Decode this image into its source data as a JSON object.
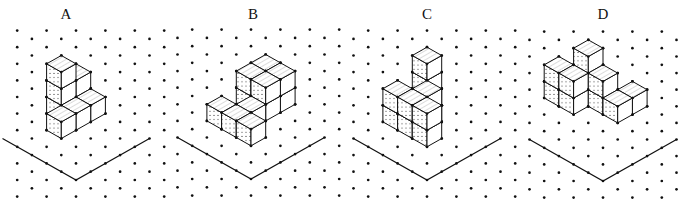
{
  "figure": {
    "ink_color": "#111111",
    "dot_color": "#111111",
    "hatch_color": "#888888",
    "grid": {
      "cx": 14.7,
      "cy": 8.3
    }
  },
  "panels": [
    {
      "label": "A",
      "label_x": 66,
      "apex": [
        76,
        180
      ],
      "x_range": [
        12,
        168
      ],
      "cubes": [
        [
          3,
          4,
          0
        ],
        [
          3,
          4,
          1
        ],
        [
          3,
          4,
          2
        ],
        [
          4,
          4,
          0
        ],
        [
          4,
          4,
          1
        ],
        [
          4,
          3,
          0
        ],
        [
          3,
          3,
          0
        ],
        [
          2,
          3,
          0
        ]
      ]
    },
    {
      "label": "B",
      "label_x": 253,
      "apex": [
        251,
        179
      ],
      "x_range": [
        175,
        342
      ],
      "cubes": [
        [
          4,
          4,
          0
        ],
        [
          4,
          4,
          1
        ],
        [
          5,
          4,
          0
        ],
        [
          5,
          4,
          1
        ],
        [
          5,
          3,
          0
        ],
        [
          5,
          3,
          1
        ],
        [
          4,
          3,
          0
        ],
        [
          4,
          3,
          1
        ],
        [
          3,
          3,
          0
        ],
        [
          2,
          4,
          0
        ],
        [
          2,
          3,
          0
        ],
        [
          2,
          2,
          0
        ]
      ]
    },
    {
      "label": "C",
      "label_x": 427,
      "apex": [
        427,
        180
      ],
      "x_range": [
        350,
        518
      ],
      "cubes": [
        [
          4,
          4,
          0
        ],
        [
          4,
          4,
          1
        ],
        [
          4,
          4,
          2
        ],
        [
          3,
          3,
          0
        ],
        [
          3,
          3,
          1
        ],
        [
          2,
          4,
          0
        ],
        [
          2,
          4,
          1
        ],
        [
          2,
          3,
          0
        ],
        [
          2,
          3,
          1
        ],
        [
          2,
          2,
          0
        ],
        [
          2,
          2,
          1
        ]
      ]
    },
    {
      "label": "D",
      "label_x": 603,
      "apex": [
        603,
        181
      ],
      "x_range": [
        524,
        690
      ],
      "cubes": [
        [
          4,
          5,
          0
        ],
        [
          4,
          5,
          1
        ],
        [
          4,
          5,
          2
        ],
        [
          3,
          6,
          0
        ],
        [
          3,
          6,
          1
        ],
        [
          4,
          4,
          0
        ],
        [
          4,
          4,
          1
        ],
        [
          5,
          3,
          0
        ],
        [
          3,
          5,
          0
        ],
        [
          3,
          5,
          1
        ],
        [
          4,
          3,
          0
        ]
      ]
    }
  ],
  "ground_arm_steps": 5
}
